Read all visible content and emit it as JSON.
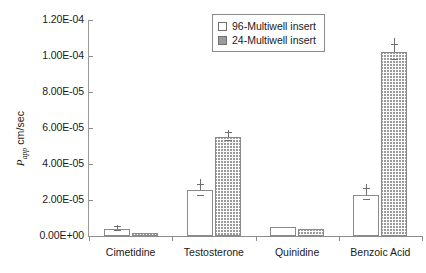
{
  "chart_data": {
    "type": "bar",
    "title": "",
    "xlabel": "",
    "ylabel": "Papp cm/sec",
    "ylabel_parts": {
      "italic": "P",
      "sub": "app",
      "rest": " cm/sec"
    },
    "categories": [
      "Cimetidine",
      "Testosterone",
      "Quinidine",
      "Benzoic Acid"
    ],
    "ylim": [
      0,
      0.00012
    ],
    "ytick_labels": [
      "0.00E+00",
      "2.00E-05",
      "4.00E-05",
      "6.00E-05",
      "8.00E-05",
      "1.00E-04",
      "1.20E-04"
    ],
    "ytick_values": [
      0,
      2e-05,
      4e-05,
      6e-05,
      8e-05,
      0.0001,
      0.00012
    ],
    "grid": false,
    "legend_position": "top-center",
    "series": [
      {
        "name": "96-Multiwell insert",
        "style": "open",
        "values": [
          4e-06,
          2.55e-05,
          5e-06,
          2.3e-05
        ],
        "errors": [
          1e-06,
          3e-06,
          0.0,
          3e-06
        ]
      },
      {
        "name": "24-Multiwell insert",
        "style": "hatched",
        "values": [
          1.5e-06,
          5.5e-05,
          4e-06,
          0.000102
        ],
        "errors": [
          0.0,
          2e-06,
          0.0,
          4e-06
        ]
      }
    ]
  },
  "legend": {
    "items": [
      {
        "label": "96-Multiwell insert",
        "style": "open"
      },
      {
        "label": "24-Multiwell insert",
        "style": "hatched"
      }
    ]
  }
}
